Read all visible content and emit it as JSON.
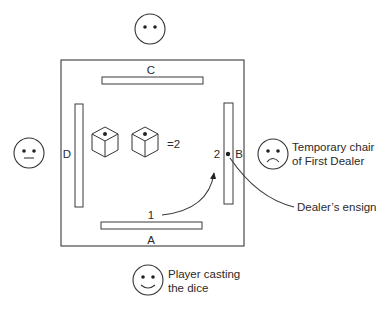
{
  "diagram": {
    "table": {
      "sides": [
        {
          "id": "A",
          "label": "A",
          "position": "bottom"
        },
        {
          "id": "B",
          "label": "B",
          "position": "right"
        },
        {
          "id": "C",
          "label": "C",
          "position": "top"
        },
        {
          "id": "D",
          "label": "D",
          "position": "left"
        }
      ]
    },
    "dice": {
      "count": 2,
      "faces_up": [
        1,
        1
      ],
      "result_label": "=2"
    },
    "count_markers": {
      "start": "1",
      "end": "2"
    },
    "players": [
      {
        "position": "top",
        "expression": "neutral-no-mouth"
      },
      {
        "position": "left",
        "expression": "neutral"
      },
      {
        "position": "right",
        "expression": "sad",
        "caption_lines": [
          "Temporary chair",
          "of First Dealer"
        ]
      },
      {
        "position": "bottom",
        "expression": "happy",
        "caption_lines": [
          "Player casting",
          "the dice"
        ]
      }
    ],
    "annotations": {
      "ensign_label": "Dealer’s ensign"
    },
    "colors": {
      "line": "#3a3a3a",
      "background": "#ffffff",
      "text": "#2a2a2a"
    }
  }
}
